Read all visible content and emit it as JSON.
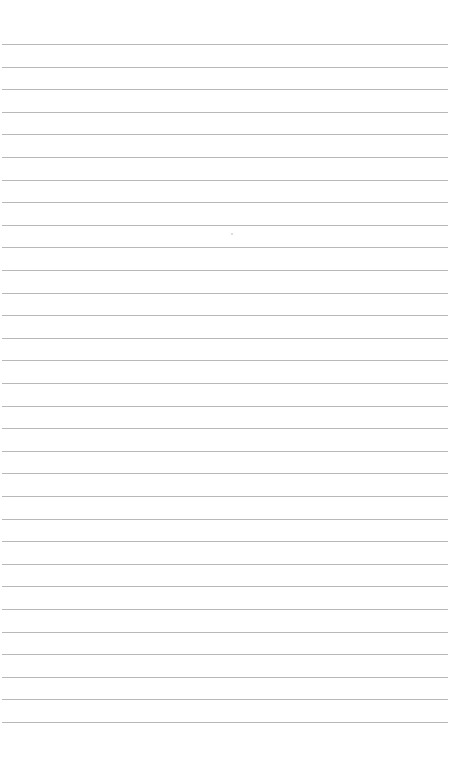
{
  "page": {
    "type": "blank lined paper",
    "background_color": "#ffffff",
    "line_color": "#b8b8b8",
    "line_count": 31,
    "first_line_y": 44,
    "line_spacing": 22.6,
    "line_left": 2,
    "line_width": 446
  }
}
